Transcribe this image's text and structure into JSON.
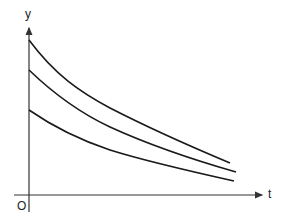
{
  "figure": {
    "type": "decay-curves",
    "axes": {
      "y_label": "y",
      "x_label": "t",
      "origin_label": "O"
    },
    "curves": [
      {
        "name": "curve-top",
        "start": [
          29,
          40
        ],
        "mid1": [
          80,
          92
        ],
        "mid2": [
          180,
          142
        ],
        "end": [
          230,
          163
        ]
      },
      {
        "name": "curve-middle",
        "start": [
          29,
          70
        ],
        "mid1": [
          80,
          113
        ],
        "mid2": [
          180,
          156
        ],
        "end": [
          236,
          172
        ]
      },
      {
        "name": "curve-bottom",
        "start": [
          29,
          110
        ],
        "mid1": [
          80,
          140
        ],
        "mid2": [
          180,
          169
        ],
        "end": [
          234,
          181
        ]
      }
    ],
    "colors": {
      "line": "#1a1a1a",
      "axis": "#333333",
      "background": "#ffffff"
    }
  }
}
